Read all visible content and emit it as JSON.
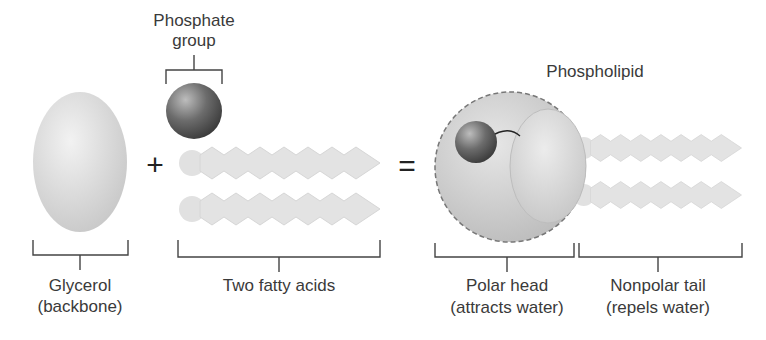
{
  "labels": {
    "phosphate_line1": "Phosphate",
    "phosphate_line2": "group",
    "glycerol_line1": "Glycerol",
    "glycerol_line2": "(backbone)",
    "fatty_acids": "Two fatty acids",
    "phospholipid": "Phospholipid",
    "polar_line1": "Polar head",
    "polar_line2": "(attracts water)",
    "nonpolar_line1": "Nonpolar tail",
    "nonpolar_line2": "(repels water)"
  },
  "operators": {
    "plus": "+",
    "equals": "="
  },
  "colors": {
    "glycerol": "#d8d8d8",
    "phosphate": "#6a6a6a",
    "fatty_acid": "#e0e0e0",
    "bracket": "#444444",
    "text": "#3a3a3a"
  }
}
